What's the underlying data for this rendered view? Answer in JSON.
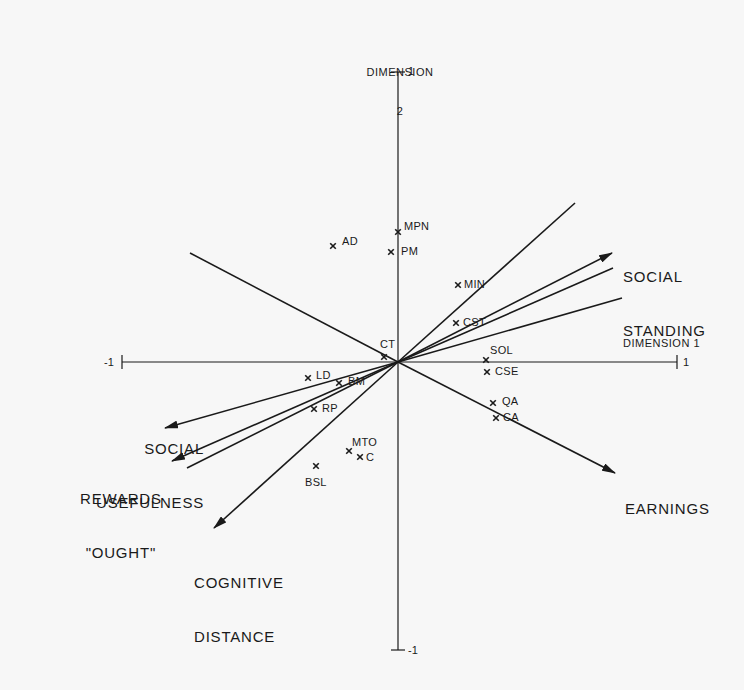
{
  "chart_data": {
    "type": "scatter",
    "title": "",
    "xlabel": "DIMENSION 1",
    "ylabel": "DIMENSION 2",
    "xlim": [
      -1,
      1
    ],
    "ylim": [
      -1,
      1
    ],
    "x_ticks": [
      "-1",
      "1"
    ],
    "y_ticks": [
      "1",
      "-1"
    ],
    "grid": false,
    "legend": null,
    "points": [
      {
        "label": "MPN",
        "x": 0.0,
        "y": 0.45
      },
      {
        "label": "PM",
        "x": -0.03,
        "y": 0.38
      },
      {
        "label": "AD",
        "x": -0.23,
        "y": 0.4
      },
      {
        "label": "MIN",
        "x": 0.22,
        "y": 0.27
      },
      {
        "label": "CST",
        "x": 0.21,
        "y": 0.14
      },
      {
        "label": "CT",
        "x": -0.05,
        "y": 0.02
      },
      {
        "label": "SOL",
        "x": 0.32,
        "y": 0.01
      },
      {
        "label": "CSE",
        "x": 0.32,
        "y": -0.03
      },
      {
        "label": "QA",
        "x": 0.34,
        "y": -0.14
      },
      {
        "label": "CA",
        "x": 0.35,
        "y": -0.19
      },
      {
        "label": "LD",
        "x": -0.32,
        "y": -0.05
      },
      {
        "label": "BM",
        "x": -0.21,
        "y": -0.07
      },
      {
        "label": "RP",
        "x": -0.3,
        "y": -0.16
      },
      {
        "label": "MTO",
        "x": -0.18,
        "y": -0.31
      },
      {
        "label": "C",
        "x": -0.14,
        "y": -0.33
      },
      {
        "label": "BSL",
        "x": -0.3,
        "y": -0.36
      }
    ],
    "vectors": [
      {
        "label": "",
        "x": 0.64,
        "y": 0.55,
        "arrow": false
      },
      {
        "label": "SOCIAL STANDING",
        "x": 0.77,
        "y": 0.38,
        "arrow": true
      },
      {
        "label": "",
        "x": 0.78,
        "y": 0.32,
        "arrow": false
      },
      {
        "label": "",
        "x": 0.81,
        "y": 0.22,
        "arrow": false
      },
      {
        "label": "",
        "x": -0.75,
        "y": 0.38,
        "arrow": false
      },
      {
        "label": "EARNINGS",
        "x": 0.78,
        "y": -0.38,
        "arrow": true
      },
      {
        "label": "SOCIAL USEFULNESS",
        "x": -0.84,
        "y": -0.23,
        "arrow": true
      },
      {
        "label": "REWARDS \"OUGHT\"",
        "x": -0.81,
        "y": -0.34,
        "arrow": true
      },
      {
        "label": "",
        "x": -0.76,
        "y": -0.37,
        "arrow": false
      },
      {
        "label": "COGNITIVE DISTANCE",
        "x": -0.66,
        "y": -0.58,
        "arrow": true
      }
    ]
  },
  "axes": {
    "dim1": {
      "title": "DIMENSION 1",
      "min_label": "-1",
      "max_label": "1"
    },
    "dim2": {
      "title_line1": "DIMENSION",
      "title_line2": "2",
      "max_label": "1",
      "min_label": "-1"
    }
  },
  "points": [
    {
      "label": "MPN",
      "px": 398,
      "py": 232,
      "lx": 404,
      "ly": 221
    },
    {
      "label": "PM",
      "px": 391,
      "py": 252,
      "lx": 401,
      "ly": 246
    },
    {
      "label": "AD",
      "px": 333,
      "py": 246,
      "lx": 342,
      "ly": 236
    },
    {
      "label": "MIN",
      "px": 458,
      "py": 285,
      "lx": 464,
      "ly": 279
    },
    {
      "label": "CST",
      "px": 456,
      "py": 323,
      "lx": 463,
      "ly": 317
    },
    {
      "label": "CT",
      "px": 384,
      "py": 357,
      "lx": 380,
      "ly": 339
    },
    {
      "label": "SOL",
      "px": 486,
      "py": 360,
      "lx": 490,
      "ly": 345
    },
    {
      "label": "CSE",
      "px": 487,
      "py": 372,
      "lx": 495,
      "ly": 366
    },
    {
      "label": "QA",
      "px": 493,
      "py": 403,
      "lx": 502,
      "ly": 396
    },
    {
      "label": "CA",
      "px": 496,
      "py": 418,
      "lx": 503,
      "ly": 412
    },
    {
      "label": "LD",
      "px": 308,
      "py": 378,
      "lx": 316,
      "ly": 370
    },
    {
      "label": "BM",
      "px": 339,
      "py": 383,
      "lx": 348,
      "ly": 376
    },
    {
      "label": "RP",
      "px": 314,
      "py": 409,
      "lx": 322,
      "ly": 403
    },
    {
      "label": "MTO",
      "px": 349,
      "py": 451,
      "lx": 352,
      "ly": 437
    },
    {
      "label": "C",
      "px": 360,
      "py": 457,
      "lx": 366,
      "ly": 452
    },
    {
      "label": "BSL",
      "px": 316,
      "py": 466,
      "lx": 305,
      "ly": 477
    }
  ],
  "vectors": [
    {
      "name": "unlabeled-vector-1",
      "x2": 575,
      "y2": 203,
      "arrow": false
    },
    {
      "name": "social-standing",
      "x2": 612,
      "y2": 253,
      "arrow": true
    },
    {
      "name": "unlabeled-vector-2",
      "x2": 613,
      "y2": 268,
      "arrow": false
    },
    {
      "name": "unlabeled-vector-3",
      "x2": 622,
      "y2": 298,
      "arrow": false
    },
    {
      "name": "unlabeled-vector-4",
      "x2": 190,
      "y2": 253,
      "arrow": false
    },
    {
      "name": "earnings",
      "x2": 615,
      "y2": 473,
      "arrow": true
    },
    {
      "name": "social-usefulness",
      "x2": 165,
      "y2": 428,
      "arrow": true
    },
    {
      "name": "rewards-ought",
      "x2": 172,
      "y2": 461,
      "arrow": true
    },
    {
      "name": "unlabeled-vector-5",
      "x2": 187,
      "y2": 468,
      "arrow": false
    },
    {
      "name": "cognitive-distance",
      "x2": 214,
      "y2": 528,
      "arrow": true
    }
  ],
  "vector_labels": {
    "social_standing": {
      "line1": "SOCIAL",
      "line2": "STANDING"
    },
    "earnings": {
      "line1": "EARNINGS"
    },
    "social_usefulness": {
      "line1": "SOCIAL",
      "line2": "USEFULNESS"
    },
    "rewards_ought": {
      "line1": "REWARDS",
      "line2": "\"OUGHT\""
    },
    "cognitive_distance": {
      "line1": "COGNITIVE",
      "line2": "DISTANCE"
    }
  },
  "colors": {
    "background": "#f7f7f7",
    "ink": "#1a1a1a"
  }
}
